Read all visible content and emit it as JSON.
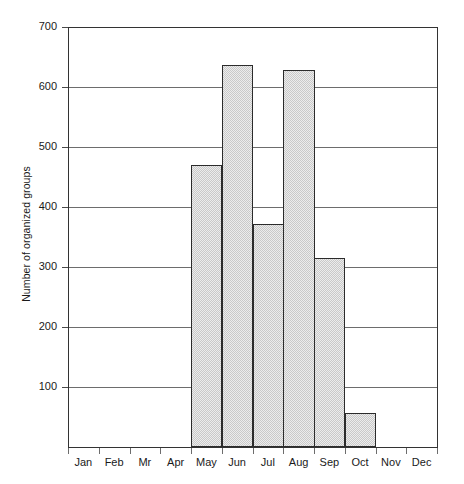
{
  "chart_data": {
    "type": "bar",
    "title": "",
    "subtitle": "",
    "xlabel": "",
    "ylabel": "Number of organized groups",
    "categories": [
      "Jan",
      "Feb",
      "Mr",
      "Apr",
      "May",
      "Jun",
      "Jul",
      "Aug",
      "Sep",
      "Oct",
      "Nov",
      "Dec"
    ],
    "values": [
      0,
      0,
      0,
      0,
      470,
      637,
      372,
      628,
      315,
      57,
      0,
      0
    ],
    "ylim": [
      0,
      700
    ],
    "ytick_labels": [
      "100",
      "200",
      "300",
      "400",
      "500",
      "600",
      "700"
    ],
    "ytick_values": [
      100,
      200,
      300,
      400,
      500,
      600,
      700
    ],
    "grid": "horizontal",
    "legend": "none",
    "bar_fill_color": "#ececec",
    "bar_edge_color": "#2b2b2b",
    "grid_color": "#6d6d6d",
    "axis_color": "#333333",
    "annotations": []
  }
}
